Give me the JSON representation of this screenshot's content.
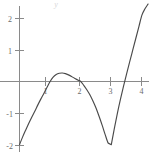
{
  "chart_data": {
    "type": "line",
    "title": "",
    "subtitle": "",
    "xlabel": "",
    "ylabel": "y",
    "xlim": [
      -0.25,
      4.35
    ],
    "ylim": [
      -2.3,
      2.45
    ],
    "grid": false,
    "legend": null,
    "x_ticks": [
      1,
      2,
      3,
      4
    ],
    "x_tick_labels": [
      "1",
      "2",
      "3",
      "4"
    ],
    "y_ticks": [
      -2,
      -1,
      1,
      2
    ],
    "y_tick_labels": [
      "-2",
      "-1",
      "1",
      "2"
    ],
    "series": [
      {
        "name": "curve",
        "color": "#4a4a4a",
        "x": [
          0.0,
          0.1,
          0.2,
          0.3,
          0.4,
          0.5,
          0.6,
          0.7,
          0.8,
          0.9,
          1.0,
          1.1,
          1.2,
          1.3,
          1.4,
          1.5,
          1.6,
          1.7,
          1.8,
          1.9,
          2.0,
          2.1,
          2.2,
          2.3,
          2.4,
          2.5,
          2.6,
          2.7,
          2.8,
          2.9,
          3.0,
          3.1,
          3.2,
          3.3,
          3.4,
          3.5,
          3.6,
          3.7,
          3.8,
          3.9,
          4.0,
          4.1,
          4.2
        ],
        "y": [
          -2.0,
          -1.76,
          -1.54,
          -1.33,
          -1.13,
          -0.94,
          -0.74,
          -0.55,
          -0.37,
          -0.18,
          0.0,
          0.14,
          0.22,
          0.26,
          0.27,
          0.25,
          0.21,
          0.16,
          0.1,
          0.05,
          0.0,
          -0.12,
          -0.26,
          -0.42,
          -0.62,
          -0.84,
          -1.1,
          -1.38,
          -1.68,
          -1.95,
          -2.0,
          -1.48,
          -1.0,
          -0.56,
          -0.15,
          0.24,
          0.62,
          0.99,
          1.36,
          1.73,
          2.1,
          2.3,
          2.45
        ]
      }
    ],
    "annotations": []
  },
  "axes": {
    "y_axis_label": "y",
    "origin": {
      "x": 0,
      "y": 0
    }
  }
}
